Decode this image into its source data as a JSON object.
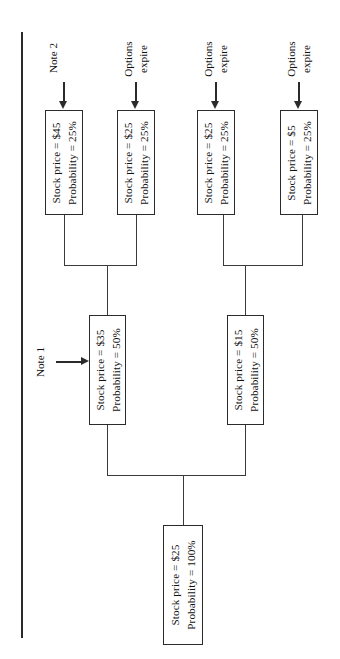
{
  "diagram": {
    "orientation": "rotated-90-ccw",
    "line_color": "#2b2b2b",
    "background": "#ffffff"
  },
  "labels": {
    "stock_price_prefix": "Stock price = ",
    "probability_prefix": "Probability = "
  },
  "nodes": {
    "root": {
      "price_line": "Stock price = $25",
      "prob_line": "Probability = 100%",
      "price": "$25",
      "probability": "100%"
    },
    "mid": [
      {
        "price_line": "Stock price = $35",
        "prob_line": "Probability = 50%",
        "price": "$35",
        "probability": "50%"
      },
      {
        "price_line": "Stock price = $15",
        "prob_line": "Probability = 50%",
        "price": "$15",
        "probability": "50%"
      }
    ],
    "leaves": [
      {
        "price_line": "Stock price = $45",
        "prob_line": "Probability = 25%",
        "price": "$45",
        "probability": "25%"
      },
      {
        "price_line": "Stock price = $25",
        "prob_line": "Probability = 25%",
        "price": "$25",
        "probability": "25%"
      },
      {
        "price_line": "Stock price = $25",
        "prob_line": "Probability = 25%",
        "price": "$25",
        "probability": "25%"
      },
      {
        "price_line": "Stock price = $5",
        "prob_line": "Probability = 25%",
        "price": "$5",
        "probability": "25%"
      }
    ]
  },
  "annotations": {
    "note1": {
      "text": "Note 1",
      "arrow": "arrow-right"
    },
    "note2": {
      "text": "Note 2",
      "arrow": "arrow-down"
    },
    "options_expire": {
      "line1": "Options",
      "line2": "expire",
      "arrow": "arrow-down"
    }
  }
}
